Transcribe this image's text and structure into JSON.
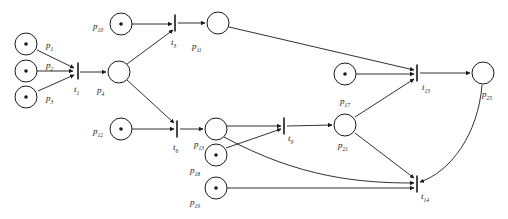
{
  "diagram": {
    "type": "petri-net",
    "title": "",
    "geometry": {
      "width": 508,
      "height": 219
    },
    "style": {
      "stroke_color": "#1a1a1a",
      "fill_color": "#ffffff",
      "place_radius": 11,
      "token_radius": 1.8,
      "transition_height": 17,
      "arrow_size": 5
    },
    "places": [
      {
        "id": "p1",
        "label": "p",
        "subscript": "1",
        "cx": 26,
        "cy": 44,
        "tokens": 1,
        "label_x": 46,
        "label_y": 48
      },
      {
        "id": "p2",
        "label": "p",
        "subscript": "2",
        "cx": 26,
        "cy": 71,
        "tokens": 1,
        "label_x": 46,
        "label_y": 68
      },
      {
        "id": "p3",
        "label": "p",
        "subscript": "3",
        "cx": 26,
        "cy": 97,
        "tokens": 1,
        "label_x": 46,
        "label_y": 101
      },
      {
        "id": "p4",
        "label": "p",
        "subscript": "4",
        "cx": 119,
        "cy": 72,
        "tokens": 0,
        "label_x": 97,
        "label_y": 93
      },
      {
        "id": "p10",
        "label": "p",
        "subscript": "10",
        "cx": 121,
        "cy": 24,
        "tokens": 1,
        "label_x": 93,
        "label_y": 29
      },
      {
        "id": "p11",
        "label": "p",
        "subscript": "11",
        "cx": 218,
        "cy": 23,
        "tokens": 0,
        "label_x": 192,
        "label_y": 49
      },
      {
        "id": "p12",
        "label": "p",
        "subscript": "12",
        "cx": 121,
        "cy": 129,
        "tokens": 1,
        "label_x": 93,
        "label_y": 134
      },
      {
        "id": "p13",
        "label": "p",
        "subscript": "13",
        "cx": 216,
        "cy": 129,
        "tokens": 0,
        "label_x": 194,
        "label_y": 147
      },
      {
        "id": "p17",
        "label": "p",
        "subscript": "17",
        "cx": 345,
        "cy": 74,
        "tokens": 1,
        "label_x": 340,
        "label_y": 104
      },
      {
        "id": "p18",
        "label": "p",
        "subscript": "18",
        "cx": 216,
        "cy": 155,
        "tokens": 1,
        "label_x": 190,
        "label_y": 173
      },
      {
        "id": "p19",
        "label": "p",
        "subscript": "19",
        "cx": 216,
        "cy": 188,
        "tokens": 1,
        "label_x": 190,
        "label_y": 205
      },
      {
        "id": "p21",
        "label": "p",
        "subscript": "21",
        "cx": 345,
        "cy": 125,
        "tokens": 0,
        "label_x": 338,
        "label_y": 148
      },
      {
        "id": "p25",
        "label": "p",
        "subscript": "25",
        "cx": 483,
        "cy": 73,
        "tokens": 0,
        "label_x": 482,
        "label_y": 97
      }
    ],
    "transitions": [
      {
        "id": "t1",
        "label": "t",
        "subscript": "1",
        "x": 78,
        "y": 71,
        "label_x": 74,
        "label_y": 92
      },
      {
        "id": "t3",
        "label": "t",
        "subscript": "3",
        "x": 175,
        "y": 23,
        "label_x": 171,
        "label_y": 45
      },
      {
        "id": "t6",
        "label": "t",
        "subscript": "6",
        "x": 177,
        "y": 129,
        "label_x": 173,
        "label_y": 150
      },
      {
        "id": "t9",
        "label": "t",
        "subscript": "9",
        "x": 284,
        "y": 126,
        "label_x": 288,
        "label_y": 141
      },
      {
        "id": "t13",
        "label": "t",
        "subscript": "13",
        "x": 417,
        "y": 73,
        "label_x": 422,
        "label_y": 90
      },
      {
        "id": "t14",
        "label": "t",
        "subscript": "14",
        "x": 417,
        "y": 184,
        "label_x": 421,
        "label_y": 199
      }
    ],
    "arcs": [
      {
        "from": "p1",
        "to": "t1",
        "path": "M 37 50 L 74 68"
      },
      {
        "from": "p2",
        "to": "t1",
        "path": "M 37 71 L 73 71"
      },
      {
        "from": "p3",
        "to": "t1",
        "path": "M 38 91 L 74 75"
      },
      {
        "from": "t1",
        "to": "p4",
        "path": "M 80 72 L 106 72"
      },
      {
        "from": "p10",
        "to": "t3",
        "path": "M 132 24 L 172 24"
      },
      {
        "from": "p4",
        "to": "t3",
        "path": "M 127 64 L 173 30"
      },
      {
        "from": "t3",
        "to": "p11",
        "path": "M 178 23 L 205 23"
      },
      {
        "from": "p12",
        "to": "t6",
        "path": "M 132 129 L 174 129"
      },
      {
        "from": "p4",
        "to": "t6",
        "path": "M 127 80 L 174 123"
      },
      {
        "from": "t6",
        "to": "p13",
        "path": "M 180 129 L 203 129"
      },
      {
        "from": "p13",
        "to": "t9",
        "path": "M 227 126 L 281 126"
      },
      {
        "from": "p18",
        "to": "t9",
        "path": "M 226 148 L 281 129"
      },
      {
        "from": "t9",
        "to": "p21",
        "path": "M 287 126 L 332 125"
      },
      {
        "from": "p11",
        "to": "t13",
        "path": "M 229 27 L 414 70"
      },
      {
        "from": "p17",
        "to": "t13",
        "path": "M 356 74 L 414 74"
      },
      {
        "from": "p21",
        "to": "t13",
        "path": "M 355 117 L 414 79"
      },
      {
        "from": "t13",
        "to": "p25",
        "path": "M 420 73 L 470 73"
      },
      {
        "from": "p21",
        "to": "t14",
        "path": "M 355 133 L 414 178"
      },
      {
        "from": "p13",
        "to": "t14",
        "curved": true,
        "path": "M 224 137 C 300 178 360 183 414 183"
      },
      {
        "from": "p19",
        "to": "t14",
        "path": "M 227 188 L 414 188"
      },
      {
        "from": "p25",
        "to": "t14",
        "curved": true,
        "path": "M 482 85 C 478 135 450 172 420 182"
      }
    ]
  }
}
